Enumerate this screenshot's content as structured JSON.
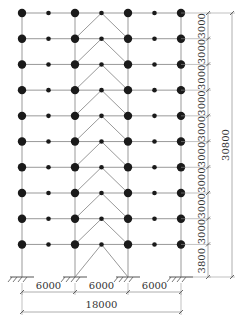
{
  "diagram": {
    "type": "structural-frame-elevation",
    "bays": 3,
    "stories": 10,
    "bay_widths_mm": [
      6000,
      6000,
      6000
    ],
    "bay_labels": [
      "6000",
      "6000",
      "6000"
    ],
    "total_width_label": "18000",
    "story_heights_mm": [
      3000,
      3000,
      3000,
      3000,
      3000,
      3000,
      3000,
      3000,
      3000,
      3800
    ],
    "story_labels": [
      "3000",
      "3000",
      "3000",
      "3000",
      "3000",
      "3000",
      "3000",
      "3000",
      "3000",
      "3800"
    ],
    "total_height_label": "30800",
    "braced_bay_index": 1,
    "brace_type": "inverted-V (chevron) per story",
    "supports": "fixed at base of each column",
    "colors": {
      "line": "#999999",
      "node": "#1a1a1a",
      "text": "#333333",
      "background": "#ffffff"
    }
  }
}
